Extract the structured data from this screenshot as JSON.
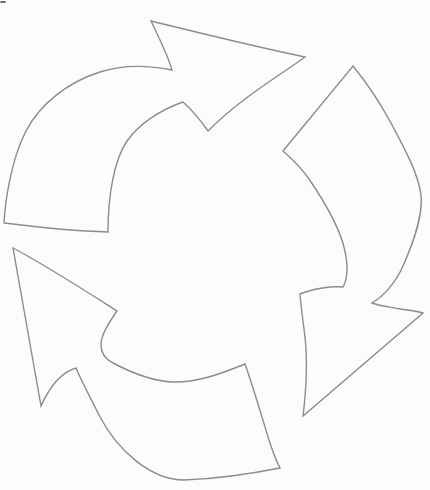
{
  "canvas": {
    "width": 430,
    "height": 490,
    "background": "#fcfcfb"
  },
  "sketch": {
    "title": "hand-drawn-cycle-of-three-curved-arrows",
    "stroke_color": "#8c8c8c",
    "stroke_width": 1.4,
    "fill_color": "none",
    "arrows": [
      {
        "name": "top-arrow-pointing-right",
        "path": "M 4 223 C 5 205 10 162 26 131 C 40 104 68 82 100 72 C 125 64 152 66 172 70 C 167 53 158 36 151 21 C 196 32 252 46 305 57 C 282 74 242 97 208 131 C 199 118 191 109 183 102 C 160 110 139 124 127 141 C 114 160 108 196 108 232 C 72 231 36 227 4 223 Z"
      },
      {
        "name": "right-arrow-pointing-down",
        "path": "M 353 66 C 362 77 378 99 391 123 C 403 146 418 172 421 195 C 423 216 414 241 403 266 C 396 282 384 296 372 303 C 380 306 390 307 400 309 C 409 310 417 311 423 313 L 303 416 C 306 392 308 365 305 337 C 303 321 301 307 300 294 C 312 289 330 286 343 287 C 348 278 348 263 344 247 C 338 224 324 201 309 179 C 300 166 291 158 283 151 Z"
      },
      {
        "name": "bottom-arrow-pointing-upper-left",
        "path": "M 13 248 C 47 266 84 290 117 311 C 108 324 101 335 101 345 C 101 354 105 359 113 363 C 132 373 153 381 172 382 C 197 383 223 373 245 364 C 251 380 261 414 269 440 C 273 453 277 462 280 468 C 250 474 213 479 184 480 C 152 480 118 452 99 415 C 91 399 82 382 76 368 C 62 372 50 386 41 406 C 32 354 22 300 13 248 Z"
      }
    ],
    "artifacts": [
      {
        "name": "scan-smudge-top-left",
        "x": 0,
        "y": 1,
        "width": 6,
        "height": 2,
        "color": "#5a5a5a"
      }
    ]
  }
}
